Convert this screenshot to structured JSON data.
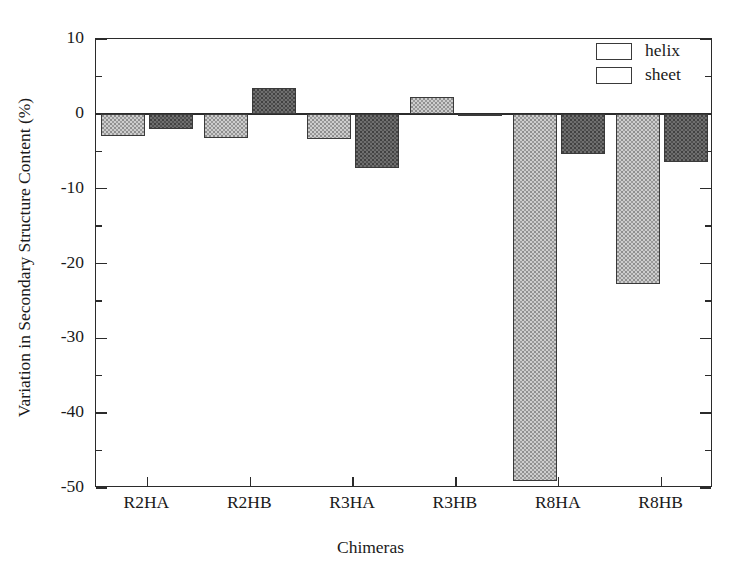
{
  "chart_data": {
    "type": "bar",
    "title": "",
    "xlabel": "Chimeras",
    "ylabel": "Variation in Secondary Structure Content (%)",
    "categories": [
      "R2HA",
      "R2HB",
      "R3HA",
      "R3HB",
      "R8HA",
      "R8HB"
    ],
    "series": [
      {
        "name": "helix",
        "values": [
          -3.0,
          -3.2,
          -3.4,
          2.2,
          -49.0,
          -22.7
        ],
        "color": "#cdcdcd"
      },
      {
        "name": "sheet",
        "values": [
          -2.0,
          3.5,
          -7.3,
          -0.3,
          -5.4,
          -6.4
        ],
        "color": "#6f6f6f"
      }
    ],
    "ylim": [
      -50,
      10
    ],
    "ytick_labels": [
      "10",
      "0",
      "-10",
      "-20",
      "-30",
      "-40",
      "-50"
    ],
    "ytick_values": [
      10,
      0,
      -10,
      -20,
      -30,
      -40,
      -50
    ],
    "yminor_values": [
      5,
      -5,
      -15,
      -25,
      -35,
      -45
    ],
    "grid": false,
    "legend_position": "top-right",
    "legend_entries": [
      "helix",
      "sheet"
    ]
  }
}
